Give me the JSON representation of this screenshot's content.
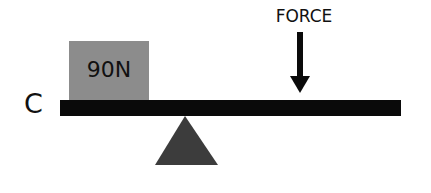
{
  "diagram": {
    "type": "lever",
    "end_label": "C",
    "load": {
      "label": "90N",
      "color": "#8c8c8c"
    },
    "force": {
      "label": "FORCE",
      "direction": "down"
    },
    "beam_color": "#0a0a0a",
    "fulcrum_color": "#3c3c3c"
  }
}
